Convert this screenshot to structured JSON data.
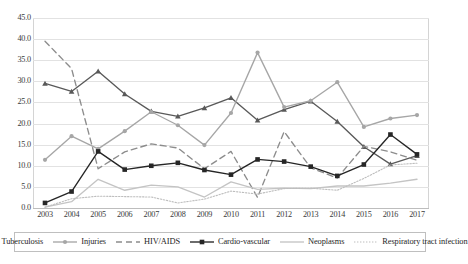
{
  "chart_data": {
    "type": "line",
    "title": "",
    "xlabel": "",
    "ylabel": "",
    "categories": [
      "2003",
      "2004",
      "2005",
      "2006",
      "2007",
      "2008",
      "2009",
      "2010",
      "2011",
      "2012",
      "2013",
      "2014",
      "2015",
      "2016",
      "2017"
    ],
    "x": [
      2003,
      2004,
      2005,
      2006,
      2007,
      2008,
      2009,
      2010,
      2011,
      2012,
      2013,
      2014,
      2015,
      2016,
      2017
    ],
    "ylim": [
      0.0,
      45.0
    ],
    "ytick_step": 5.0,
    "ytick_labels": [
      "0.0",
      "5.0",
      "10.0",
      "15.0",
      "20.0",
      "25.0",
      "30.0",
      "35.0",
      "40.0",
      "45.0"
    ],
    "ytick_values": [
      0.0,
      5.0,
      10.0,
      15.0,
      20.0,
      25.0,
      30.0,
      35.0,
      40.0,
      45.0
    ],
    "grid": true,
    "legend_position": "bottom",
    "series": [
      {
        "name": "Tuberculosis",
        "color": "#595959",
        "style": "solid",
        "marker": "triangle",
        "values": [
          29.5,
          27.6,
          32.4,
          27.0,
          22.9,
          21.7,
          23.7,
          26.1,
          20.8,
          23.3,
          25.3,
          20.5,
          14.5,
          10.4,
          12.4
        ]
      },
      {
        "name": "Injuries",
        "color": "#a6a6a6",
        "style": "solid",
        "marker": "circle",
        "values": [
          11.4,
          17.0,
          14.0,
          18.2,
          22.8,
          19.6,
          14.9,
          22.5,
          36.8,
          23.9,
          25.4,
          29.8,
          19.2,
          21.2,
          22.0
        ]
      },
      {
        "name": "HIV/AIDS",
        "color": "#8c8c8c",
        "style": "dashed",
        "marker": "none",
        "values": [
          39.5,
          33.0,
          9.3,
          13.3,
          15.2,
          14.2,
          9.3,
          13.4,
          2.5,
          18.1,
          9.5,
          7.1,
          14.6,
          13.3,
          11.3
        ]
      },
      {
        "name": "Cardio-vascular",
        "color": "#262626",
        "style": "solid",
        "marker": "square",
        "values": [
          1.2,
          3.9,
          13.4,
          9.1,
          10.0,
          10.7,
          9.0,
          7.9,
          11.5,
          11.0,
          9.8,
          7.6,
          10.3,
          17.4,
          12.7
        ]
      },
      {
        "name": "Neoplasms",
        "color": "#c4c4c4",
        "style": "solid",
        "marker": "none",
        "values": [
          0.2,
          1.5,
          6.8,
          4.2,
          5.4,
          5.0,
          2.6,
          6.2,
          4.4,
          4.7,
          4.6,
          5.2,
          5.2,
          5.9,
          6.8
        ]
      },
      {
        "name": "Respiratory tract infection",
        "color": "#bdbdbd",
        "style": "dotted",
        "marker": "none",
        "values": [
          0.2,
          2.2,
          2.8,
          2.7,
          2.6,
          1.2,
          2.1,
          4.0,
          3.3,
          4.6,
          4.7,
          4.2,
          7.0,
          10.2,
          10.6
        ]
      }
    ]
  },
  "legend": {
    "items": [
      {
        "label": "Tuberculosis"
      },
      {
        "label": "Injuries"
      },
      {
        "label": "HIV/AIDS"
      },
      {
        "label": "Cardio-vascular"
      },
      {
        "label": "Neoplasms"
      },
      {
        "label": "Respiratory tract infection"
      }
    ]
  }
}
